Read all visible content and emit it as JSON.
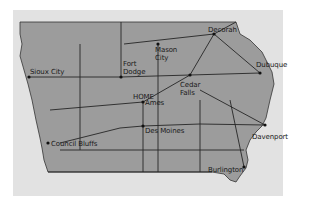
{
  "map": {
    "region": "Iowa",
    "colors": {
      "background": "#e2e2e2",
      "state_fill": "#9c9c9c",
      "roads": "#262626",
      "city_dot": "#111111"
    },
    "cities": [
      {
        "id": "sioux-city",
        "label": "Sioux City",
        "x": 29,
        "y": 77
      },
      {
        "id": "fort-dodge",
        "label": "Fort\nDodge",
        "x": 121,
        "y": 77
      },
      {
        "id": "mason-city",
        "label": "Mason\nCity",
        "x": 158,
        "y": 44
      },
      {
        "id": "decorah",
        "label": "Decorah",
        "x": 214,
        "y": 34
      },
      {
        "id": "dubuque",
        "label": "Dubuque",
        "x": 260,
        "y": 73
      },
      {
        "id": "cedar-falls",
        "label": "Cedar\nFalls",
        "x": 190,
        "y": 75
      },
      {
        "id": "ames",
        "label": "Ames",
        "x": 143,
        "y": 102
      },
      {
        "id": "des-moines",
        "label": "Des Moines",
        "x": 143,
        "y": 126
      },
      {
        "id": "council-bluffs",
        "label": "Council Bluffs",
        "x": 48,
        "y": 143
      },
      {
        "id": "davenport",
        "label": "Davenport",
        "x": 265,
        "y": 125
      },
      {
        "id": "burlington",
        "label": "Burlington",
        "x": 244,
        "y": 167
      }
    ],
    "home_label": "HOME"
  }
}
